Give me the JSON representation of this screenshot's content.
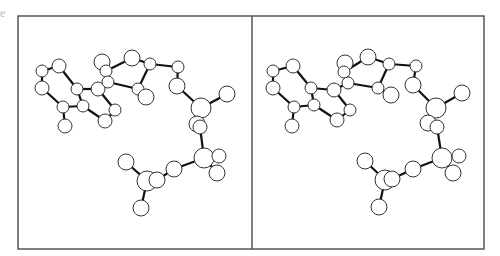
{
  "figure": {
    "corner_label": "e",
    "frame": {
      "x1": 18,
      "y1": 16,
      "x2": 484,
      "y2": 249,
      "divider_x": 252,
      "stroke": "#555555"
    },
    "bond_color": "#111111",
    "atom_stroke": "#333333",
    "atom_fill": "#ffffff"
  },
  "panels": [
    {
      "name": "left-stereo-view",
      "atoms": [
        [
          42,
          71,
          6
        ],
        [
          59,
          66,
          7
        ],
        [
          42,
          88,
          7
        ],
        [
          77,
          89,
          6
        ],
        [
          63,
          107,
          6
        ],
        [
          65,
          126,
          7
        ],
        [
          83,
          106,
          6
        ],
        [
          98,
          89,
          7
        ],
        [
          102,
          62,
          8
        ],
        [
          106,
          71,
          6
        ],
        [
          108,
          82,
          6
        ],
        [
          115,
          110,
          6
        ],
        [
          105,
          121,
          7
        ],
        [
          132,
          58,
          8
        ],
        [
          150,
          64,
          6
        ],
        [
          138,
          89,
          6
        ],
        [
          146,
          97,
          8
        ],
        [
          178,
          67,
          6
        ],
        [
          177,
          86,
          8
        ],
        [
          201,
          108,
          10
        ],
        [
          227,
          94,
          8
        ],
        [
          197,
          124,
          8
        ],
        [
          200,
          127,
          7
        ],
        [
          204,
          158,
          10
        ],
        [
          219,
          156,
          7
        ],
        [
          217,
          173,
          8
        ],
        [
          174,
          169,
          8
        ],
        [
          126,
          162,
          8
        ],
        [
          147,
          181,
          10
        ],
        [
          157,
          180,
          8
        ],
        [
          141,
          208,
          8
        ]
      ],
      "bonds": [
        [
          0,
          1
        ],
        [
          0,
          2
        ],
        [
          1,
          3
        ],
        [
          2,
          4
        ],
        [
          3,
          6
        ],
        [
          4,
          6
        ],
        [
          4,
          5
        ],
        [
          3,
          7
        ],
        [
          7,
          10
        ],
        [
          6,
          12
        ],
        [
          7,
          11
        ],
        [
          11,
          12
        ],
        [
          10,
          9
        ],
        [
          9,
          8
        ],
        [
          10,
          15
        ],
        [
          9,
          13
        ],
        [
          13,
          14
        ],
        [
          14,
          15
        ],
        [
          15,
          16
        ],
        [
          14,
          17
        ],
        [
          17,
          18
        ],
        [
          18,
          19
        ],
        [
          19,
          20
        ],
        [
          19,
          21
        ],
        [
          22,
          23
        ],
        [
          23,
          24
        ],
        [
          23,
          25
        ],
        [
          23,
          26
        ],
        [
          26,
          29
        ],
        [
          29,
          28
        ],
        [
          28,
          27
        ],
        [
          28,
          30
        ]
      ]
    },
    {
      "name": "right-stereo-view",
      "atoms": [
        [
          273,
          71,
          6
        ],
        [
          293,
          66,
          7
        ],
        [
          273,
          88,
          7
        ],
        [
          311,
          88,
          6
        ],
        [
          294,
          107,
          6
        ],
        [
          292,
          126,
          7
        ],
        [
          314,
          105,
          6
        ],
        [
          334,
          90,
          7
        ],
        [
          345,
          63,
          8
        ],
        [
          344,
          72,
          6
        ],
        [
          348,
          83,
          6
        ],
        [
          350,
          110,
          6
        ],
        [
          337,
          120,
          7
        ],
        [
          368,
          57,
          8
        ],
        [
          389,
          64,
          6
        ],
        [
          378,
          88,
          6
        ],
        [
          391,
          95,
          8
        ],
        [
          416,
          66,
          6
        ],
        [
          413,
          85,
          8
        ],
        [
          436,
          108,
          10
        ],
        [
          462,
          93,
          8
        ],
        [
          428,
          123,
          8
        ],
        [
          437,
          127,
          7
        ],
        [
          442,
          158,
          10
        ],
        [
          459,
          156,
          7
        ],
        [
          453,
          173,
          8
        ],
        [
          413,
          169,
          8
        ],
        [
          365,
          161,
          8
        ],
        [
          385,
          180,
          10
        ],
        [
          392,
          179,
          8
        ],
        [
          379,
          207,
          8
        ]
      ],
      "bonds": [
        [
          0,
          1
        ],
        [
          0,
          2
        ],
        [
          1,
          3
        ],
        [
          2,
          4
        ],
        [
          3,
          6
        ],
        [
          4,
          6
        ],
        [
          4,
          5
        ],
        [
          3,
          7
        ],
        [
          7,
          10
        ],
        [
          6,
          12
        ],
        [
          7,
          11
        ],
        [
          11,
          12
        ],
        [
          10,
          9
        ],
        [
          9,
          8
        ],
        [
          10,
          15
        ],
        [
          9,
          13
        ],
        [
          13,
          14
        ],
        [
          14,
          15
        ],
        [
          15,
          16
        ],
        [
          14,
          17
        ],
        [
          17,
          18
        ],
        [
          18,
          19
        ],
        [
          19,
          20
        ],
        [
          19,
          21
        ],
        [
          22,
          23
        ],
        [
          23,
          24
        ],
        [
          23,
          25
        ],
        [
          23,
          26
        ],
        [
          26,
          29
        ],
        [
          29,
          28
        ],
        [
          28,
          27
        ],
        [
          28,
          30
        ]
      ]
    }
  ]
}
